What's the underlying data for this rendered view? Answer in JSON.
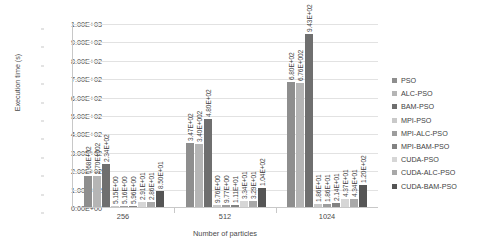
{
  "chart_data": {
    "type": "bar",
    "title": "",
    "xlabel": "Number of particles",
    "ylabel": "Execution time (s)",
    "categories": [
      "256",
      "512",
      "1024"
    ],
    "ylim": [
      0,
      1000
    ],
    "ytick_labels": [
      "1.00E+03",
      "9.00E+02",
      "8.00E+02",
      "7.00E+02",
      "6.00E+02",
      "5.00E+02",
      "4.00E+02",
      "3.00E+02",
      "2.00E+02",
      "1.00E+02",
      "0.00E+00"
    ],
    "ytick_values": [
      1000,
      900,
      800,
      700,
      600,
      500,
      400,
      300,
      200,
      100,
      0
    ],
    "grid": true,
    "legend_position": "right",
    "series": [
      {
        "name": "PSO",
        "color": "#8e8e8e",
        "values": [
          168,
          347,
          680
        ],
        "labels": [
          "1.68E+02",
          "3.47E+02",
          "6.80E+02"
        ]
      },
      {
        "name": "ALC-PSO",
        "color": "#b5b5b5",
        "values": [
          170,
          340,
          676
        ],
        "labels": [
          "1.70E+002",
          "3.40E+002",
          "6.76E+002"
        ]
      },
      {
        "name": "BAM-PSO",
        "color": "#6f6f6f",
        "values": [
          234,
          480,
          943
        ],
        "labels": [
          "2.34E+02",
          "4.80E+02",
          "9.43E+02"
        ]
      },
      {
        "name": "MPI-PSO",
        "color": "#c9c9c9",
        "values": [
          5.15,
          9.76,
          18.6
        ],
        "labels": [
          "5.15E+00",
          "9.76E+00",
          "1.86E+01"
        ]
      },
      {
        "name": "MPI-ALC-PSO",
        "color": "#9d9d9d",
        "values": [
          5.16,
          9.77,
          18.6
        ],
        "labels": [
          "5.16E+00",
          "9.77E+00",
          "1.86E+01"
        ]
      },
      {
        "name": "MPI-BAM-PSO",
        "color": "#828282",
        "values": [
          5.96,
          11.1,
          21.4
        ],
        "labels": [
          "5.96E+00",
          "1.11E+01",
          "2.14E+01"
        ]
      },
      {
        "name": "CUDA-PSO",
        "color": "#d6d6d6",
        "values": [
          29.1,
          33.4,
          43.7
        ],
        "labels": [
          "2.91E+01",
          "3.34E+01",
          "4.37E+01"
        ]
      },
      {
        "name": "CUDA-ALC-PSO",
        "color": "#a8a8a8",
        "values": [
          28.6,
          32.9,
          43.4
        ],
        "labels": [
          "2.86E+01",
          "3.29E+01",
          "4.34E+01"
        ]
      },
      {
        "name": "CUDA-BAM-PSO",
        "color": "#555555",
        "values": [
          85.0,
          104,
          120
        ],
        "labels": [
          "8.50E+01",
          "1.04E+02",
          "1.20E+02"
        ]
      }
    ]
  }
}
